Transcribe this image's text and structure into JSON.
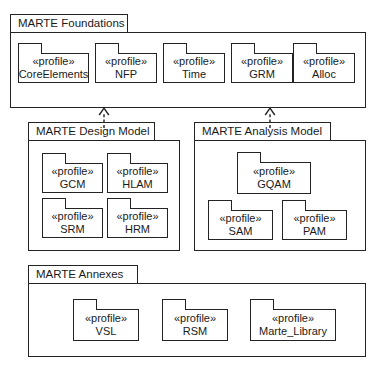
{
  "diagram": {
    "type": "uml-package-diagram",
    "stereotype_label": "«profile»",
    "colors": {
      "line": "#232323",
      "background": "#ffffff",
      "text": "#1a1a1a"
    },
    "groups": [
      {
        "id": "foundations",
        "label": "MARTE Foundations",
        "packages": [
          {
            "id": "core-elements",
            "stereotype": "«profile»",
            "name": "CoreElements"
          },
          {
            "id": "nfp",
            "stereotype": "«profile»",
            "name": "NFP"
          },
          {
            "id": "time",
            "stereotype": "«profile»",
            "name": "Time"
          },
          {
            "id": "grm",
            "stereotype": "«profile»",
            "name": "GRM"
          },
          {
            "id": "alloc",
            "stereotype": "«profile»",
            "name": "Alloc"
          }
        ]
      },
      {
        "id": "design-model",
        "label": "MARTE Design Model",
        "packages": [
          {
            "id": "gcm",
            "stereotype": "«profile»",
            "name": "GCM"
          },
          {
            "id": "hlam",
            "stereotype": "«profile»",
            "name": "HLAM"
          },
          {
            "id": "srm",
            "stereotype": "«profile»",
            "name": "SRM"
          },
          {
            "id": "hrm",
            "stereotype": "«profile»",
            "name": "HRM"
          }
        ]
      },
      {
        "id": "analysis-model",
        "label": "MARTE Analysis Model",
        "packages": [
          {
            "id": "gqam",
            "stereotype": "«profile»",
            "name": "GQAM"
          },
          {
            "id": "sam",
            "stereotype": "«profile»",
            "name": "SAM"
          },
          {
            "id": "pam",
            "stereotype": "«profile»",
            "name": "PAM"
          }
        ]
      },
      {
        "id": "annexes",
        "label": "MARTE Annexes",
        "packages": [
          {
            "id": "vsl",
            "stereotype": "«profile»",
            "name": "VSL"
          },
          {
            "id": "rsm",
            "stereotype": "«profile»",
            "name": "RSM"
          },
          {
            "id": "marte-library",
            "stereotype": "«profile»",
            "name": "Marte_Library"
          }
        ]
      }
    ],
    "dependencies": [
      {
        "id": "design-to-foundations",
        "from": "design-model",
        "to": "foundations",
        "style": "dashed",
        "arrow": "open"
      },
      {
        "id": "analysis-to-foundations",
        "from": "analysis-model",
        "to": "foundations",
        "style": "dashed",
        "arrow": "open"
      }
    ]
  }
}
